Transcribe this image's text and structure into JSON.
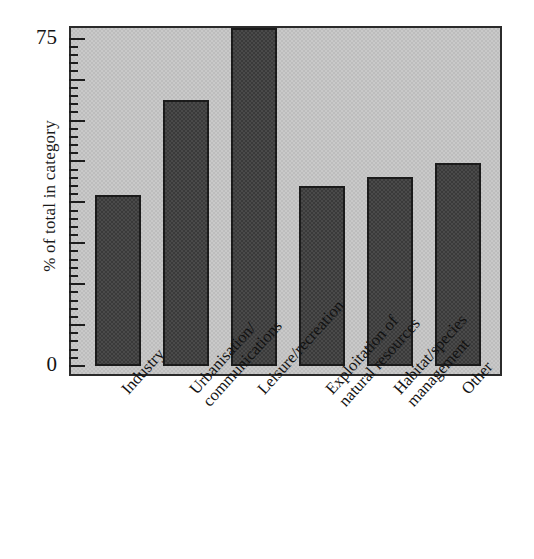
{
  "chart_data": {
    "type": "bar",
    "title": "",
    "subtitle": "",
    "xlabel": "",
    "ylabel": "% of total in category",
    "categories": [
      "Industry",
      "Urbanisation/ communications",
      "Leisure/recreation",
      "Exploitation of natural resources",
      "Habitat/species management",
      "Other"
    ],
    "category_lines": [
      [
        "Industry"
      ],
      [
        "Urbanisation/",
        "communications"
      ],
      [
        "Leisure/recreation"
      ],
      [
        "Exploitation of",
        "natural resources"
      ],
      [
        "Habitat/species",
        "management"
      ],
      [
        "Other"
      ]
    ],
    "values": [
      38,
      59,
      75,
      40,
      42,
      45
    ],
    "ylim": [
      0,
      75
    ],
    "ytick_labels": [
      "0",
      "75"
    ],
    "ytick_values": [
      0,
      75
    ],
    "grid": false,
    "legend": false,
    "legend_position": "none",
    "bar_color": "#4a4a4a",
    "bar_edge_color": "#1b1b1b",
    "plot_background_color": "#c9c9c9",
    "axis_color": "#2b2b2b",
    "minor_ticks": true,
    "minor_tick_count_between_majors": 4
  },
  "axis": {
    "y_top_label": "75",
    "y_zero_label": "0",
    "y_title": "% of total in category"
  }
}
